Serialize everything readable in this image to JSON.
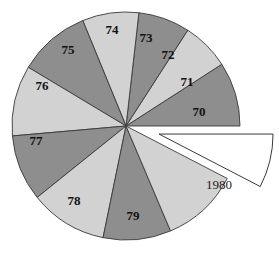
{
  "chart_data": {
    "type": "pie",
    "title": "",
    "subtitle": "",
    "xlabel": "",
    "ylabel": "",
    "legend_position": "none",
    "grid": false,
    "direction": "counter-clockwise",
    "start_angle_deg": 0,
    "center": {
      "x": 126,
      "y": 126
    },
    "radius": 114,
    "categories": [
      "70",
      "71",
      "72",
      "73",
      "74",
      "75",
      "76",
      "77",
      "78",
      "79",
      "1980"
    ],
    "labels": [
      "70",
      "71",
      "72",
      "73",
      "74",
      "75",
      "76",
      "77",
      "78",
      "79",
      "1980"
    ],
    "values": [
      9.1,
      6.8,
      7.3,
      8.0,
      10.2,
      10.0,
      9.4,
      11.0,
      9.6,
      11.0,
      7.6
    ],
    "units": "percent",
    "slices": [
      {
        "label": "70",
        "value": 9.1,
        "start_deg": 0.0,
        "end_deg": 32.8,
        "color": "#8e8e8e",
        "exploded": false,
        "label_x": 199,
        "label_y": 113
      },
      {
        "label": "71",
        "value": 6.8,
        "start_deg": 32.8,
        "end_deg": 57.2,
        "color": "#d2d2d2",
        "exploded": false,
        "label_x": 187,
        "label_y": 83
      },
      {
        "label": "72",
        "value": 7.3,
        "start_deg": 57.2,
        "end_deg": 83.5,
        "color": "#8e8e8e",
        "exploded": false,
        "label_x": 168,
        "label_y": 56
      },
      {
        "label": "73",
        "value": 8.0,
        "start_deg": 83.5,
        "end_deg": 112.3,
        "color": "#d2d2d2",
        "exploded": false,
        "label_x": 146,
        "label_y": 39
      },
      {
        "label": "74",
        "value": 10.2,
        "start_deg": 112.3,
        "end_deg": 149.0,
        "color": "#8e8e8e",
        "exploded": false,
        "label_x": 112,
        "label_y": 31
      },
      {
        "label": "75",
        "value": 10.0,
        "start_deg": 149.0,
        "end_deg": 185.0,
        "color": "#d2d2d2",
        "exploded": false,
        "label_x": 68,
        "label_y": 51
      },
      {
        "label": "76",
        "value": 9.4,
        "start_deg": 185.0,
        "end_deg": 218.8,
        "color": "#8e8e8e",
        "exploded": false,
        "label_x": 42,
        "label_y": 87
      },
      {
        "label": "77",
        "value": 11.0,
        "start_deg": 218.8,
        "end_deg": 258.4,
        "color": "#d2d2d2",
        "exploded": false,
        "label_x": 36,
        "label_y": 142
      },
      {
        "label": "78",
        "value": 9.6,
        "start_deg": 258.4,
        "end_deg": 293.0,
        "color": "#8e8e8e",
        "exploded": false,
        "label_x": 74,
        "label_y": 202
      },
      {
        "label": "79",
        "value": 11.0,
        "start_deg": 293.0,
        "end_deg": 332.6,
        "color": "#d2d2d2",
        "exploded": false,
        "label_x": 133,
        "label_y": 217
      },
      {
        "label": "1980",
        "value": 7.6,
        "start_deg": 332.6,
        "end_deg": 360.0,
        "color": "#ffffff",
        "exploded": true,
        "label_x": 219,
        "label_y": 186
      }
    ],
    "colors": {
      "dark_slice": "#8e8e8e",
      "light_slice": "#d2d2d2",
      "exploded_slice": "#ffffff",
      "outline": "#3a3a3a",
      "label_text": "#111111",
      "background": "#ffffff"
    },
    "annotations": [
      {
        "text": "1980",
        "note": "exploded slice label"
      }
    ]
  }
}
